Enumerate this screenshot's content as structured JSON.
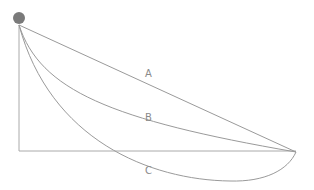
{
  "diagram": {
    "title": "",
    "ball": {
      "color": "#7a7a7a"
    },
    "paths": [
      {
        "id": "A",
        "label": "A",
        "kind": "straight line"
      },
      {
        "id": "B",
        "label": "B",
        "kind": "curve"
      },
      {
        "id": "C",
        "label": "C",
        "kind": "cycloid"
      }
    ],
    "line_color": "#9a9a9a"
  }
}
